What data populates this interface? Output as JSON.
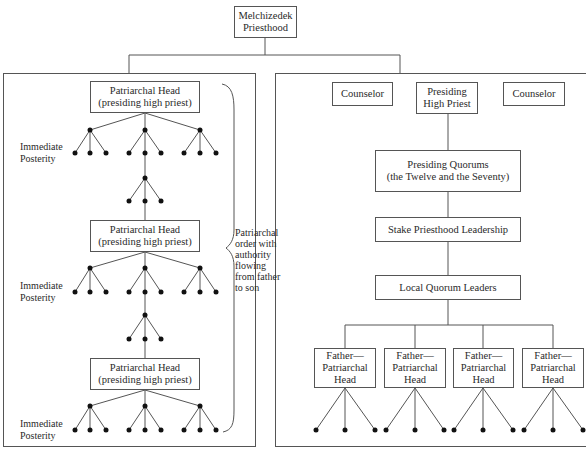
{
  "root": {
    "label": "Melchizedek\nPriesthood"
  },
  "left_panel": {
    "patriarchal_heads": [
      {
        "label": "Patriarchal Head\n(presiding high priest)"
      },
      {
        "label": "Patriarchal Head\n(presiding high priest)"
      },
      {
        "label": "Patriarchal Head\n(presiding high priest)"
      }
    ],
    "posterity_labels": [
      {
        "label": "Immediate\nPosterity"
      },
      {
        "label": "Immediate\nPosterity"
      },
      {
        "label": "Immediate\nPosterity"
      }
    ],
    "brace_annotation": "Patriarchal\norder with\nauthority\nflowing\nfrom father\nto son"
  },
  "right_panel": {
    "top_row": [
      {
        "label": "Counselor"
      },
      {
        "label": "Presiding\nHigh Priest"
      },
      {
        "label": "Counselor"
      }
    ],
    "chain": [
      {
        "label": "Presiding Quorums\n(the Twelve and the Seventy)"
      },
      {
        "label": "Stake Priesthood Leadership"
      },
      {
        "label": "Local Quorum Leaders"
      }
    ],
    "fathers": [
      {
        "label": "Father—\nPatriarchal\nHead"
      },
      {
        "label": "Father—\nPatriarchal\nHead"
      },
      {
        "label": "Father—\nPatriarchal\nHead"
      },
      {
        "label": "Father—\nPatriarchal\nHead"
      }
    ]
  },
  "colors": {
    "line": "#555555",
    "dot": "#111111",
    "text": "#2a2a2a",
    "background": "#ffffff"
  }
}
